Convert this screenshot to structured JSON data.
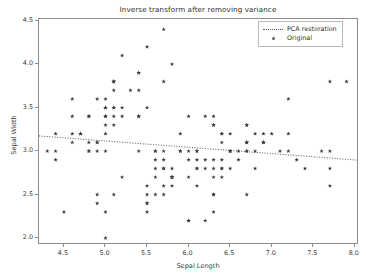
{
  "chart_data": {
    "type": "scatter",
    "title": "Inverse transform after removing variance",
    "xlabel": "Sepal Length",
    "ylabel": "Sepal Width",
    "xlim": [
      4.2,
      8.05
    ],
    "ylim": [
      1.92,
      4.52
    ],
    "xticks": [
      "4.5",
      "5.0",
      "5.5",
      "6.0",
      "6.5",
      "7.0",
      "7.5",
      "8.0"
    ],
    "xtick_values": [
      4.5,
      5.0,
      5.5,
      6.0,
      6.5,
      7.0,
      7.5,
      8.0
    ],
    "yticks": [
      "2.0",
      "2.5",
      "3.0",
      "3.5",
      "4.0",
      "4.5"
    ],
    "ytick_values": [
      2.0,
      2.5,
      3.0,
      3.5,
      4.0,
      4.5
    ],
    "grid": false,
    "legend_position": "upper right",
    "marker_color": "#3c3c3c",
    "line_color": "#555555",
    "series": [
      {
        "name": "PCA restoration",
        "type": "line",
        "style": "dotted",
        "x": [
          4.2,
          8.05
        ],
        "y": [
          3.175,
          2.895
        ]
      },
      {
        "name": "Original",
        "type": "scatter",
        "marker": "star",
        "x": [
          5.1,
          4.9,
          4.7,
          4.6,
          5.0,
          5.4,
          4.6,
          5.0,
          4.4,
          4.9,
          5.4,
          4.8,
          4.8,
          4.3,
          5.8,
          5.7,
          5.4,
          5.1,
          5.7,
          5.1,
          5.4,
          5.1,
          4.6,
          5.1,
          4.8,
          5.0,
          5.0,
          5.2,
          5.2,
          4.7,
          4.8,
          5.4,
          5.2,
          5.5,
          4.9,
          5.0,
          5.5,
          4.9,
          4.4,
          5.1,
          5.0,
          4.5,
          4.4,
          5.0,
          5.1,
          4.8,
          5.1,
          4.6,
          5.3,
          5.0,
          7.0,
          6.4,
          6.9,
          5.5,
          6.5,
          5.7,
          6.3,
          4.9,
          6.6,
          5.2,
          5.0,
          5.9,
          6.0,
          6.1,
          5.6,
          6.7,
          5.6,
          5.8,
          6.2,
          5.6,
          5.9,
          6.1,
          6.3,
          6.1,
          6.4,
          6.6,
          6.8,
          6.7,
          6.0,
          5.7,
          5.5,
          5.5,
          5.8,
          6.0,
          5.4,
          6.0,
          6.7,
          6.3,
          5.6,
          5.5,
          5.5,
          6.1,
          5.8,
          5.0,
          5.6,
          5.7,
          5.7,
          6.2,
          5.1,
          5.7,
          6.3,
          5.8,
          7.1,
          6.3,
          6.5,
          7.6,
          4.9,
          7.3,
          6.7,
          7.2,
          6.5,
          6.4,
          6.8,
          5.7,
          5.8,
          6.4,
          6.5,
          7.7,
          7.7,
          6.0,
          6.9,
          5.6,
          7.7,
          6.3,
          6.7,
          7.2,
          6.2,
          6.1,
          6.4,
          7.2,
          7.4,
          7.9,
          6.4,
          6.3,
          6.1,
          7.7,
          6.3,
          6.4,
          6.0,
          6.9,
          6.7,
          6.9,
          5.8,
          6.8,
          6.7,
          6.7,
          6.3,
          6.5,
          6.2,
          5.9
        ],
        "y": [
          3.5,
          3.0,
          3.2,
          3.1,
          3.6,
          3.9,
          3.4,
          3.4,
          2.9,
          3.1,
          3.7,
          3.4,
          3.0,
          3.0,
          4.0,
          4.4,
          3.9,
          3.5,
          3.8,
          3.8,
          3.4,
          3.7,
          3.6,
          3.3,
          3.4,
          3.0,
          3.4,
          3.5,
          3.4,
          3.2,
          3.1,
          3.4,
          4.1,
          4.2,
          3.1,
          3.2,
          3.5,
          3.6,
          3.0,
          3.4,
          3.5,
          2.3,
          3.2,
          3.5,
          3.8,
          3.0,
          3.8,
          3.2,
          3.7,
          3.3,
          3.2,
          3.2,
          3.1,
          2.3,
          2.8,
          2.8,
          3.3,
          2.4,
          2.9,
          2.7,
          2.0,
          3.0,
          2.2,
          2.9,
          2.9,
          3.1,
          3.0,
          2.7,
          2.2,
          2.5,
          3.2,
          2.8,
          2.5,
          2.8,
          2.9,
          3.0,
          2.8,
          3.0,
          2.9,
          2.6,
          2.4,
          2.4,
          2.7,
          2.7,
          3.0,
          3.4,
          3.1,
          2.3,
          3.0,
          2.5,
          2.6,
          3.0,
          2.6,
          2.3,
          2.7,
          3.0,
          2.9,
          2.9,
          2.5,
          2.8,
          3.3,
          2.7,
          3.0,
          2.9,
          3.0,
          3.0,
          2.5,
          2.9,
          2.5,
          3.6,
          3.2,
          2.7,
          3.0,
          2.5,
          2.8,
          3.2,
          3.0,
          3.8,
          2.6,
          2.2,
          3.2,
          2.8,
          2.8,
          2.7,
          3.3,
          3.2,
          2.8,
          3.0,
          2.8,
          3.0,
          2.8,
          3.8,
          2.8,
          2.8,
          2.6,
          3.0,
          3.4,
          3.1,
          3.0,
          3.1,
          3.1,
          3.1,
          2.7,
          3.2,
          3.3,
          3.0,
          2.5,
          3.0,
          3.4,
          3.0
        ]
      }
    ],
    "legend": [
      {
        "label": "PCA restoration",
        "key": "dotted-line"
      },
      {
        "label": "Original",
        "key": "star-marker"
      }
    ]
  }
}
